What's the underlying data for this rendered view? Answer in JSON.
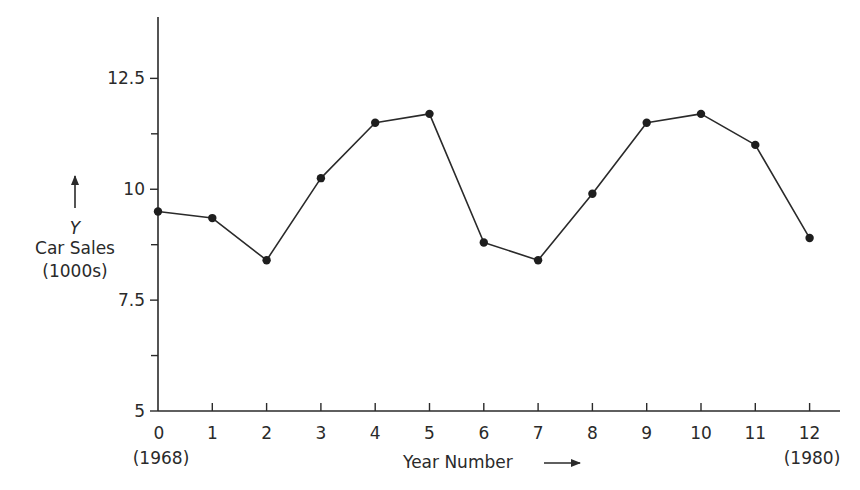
{
  "chart_data": {
    "type": "line",
    "title": "",
    "xlabel": "Year Number",
    "ylabel": "Car Sales (1000s)",
    "ylabel_symbol": "Y",
    "x": [
      0,
      1,
      2,
      3,
      4,
      5,
      6,
      7,
      8,
      9,
      10,
      11,
      12
    ],
    "x_tick_labels": [
      "0",
      "1",
      "2",
      "3",
      "4",
      "5",
      "6",
      "7",
      "8",
      "9",
      "10",
      "11",
      "12"
    ],
    "x_annotations": [
      {
        "at": 0,
        "text": "(1968)"
      },
      {
        "at": 12,
        "text": "(1980)"
      }
    ],
    "y_ticks": [
      5,
      7.5,
      10,
      12.5
    ],
    "y_tick_labels": [
      "5",
      "7.5",
      "10",
      "12.5"
    ],
    "y_minor_ticks": [
      6.25,
      8.75,
      11.25
    ],
    "series": [
      {
        "name": "Car Sales",
        "values": [
          9.5,
          9.35,
          8.4,
          10.25,
          11.5,
          11.7,
          8.8,
          8.4,
          9.9,
          11.5,
          11.7,
          11.0,
          8.9
        ],
        "markers": true,
        "color": "#1e1e1e"
      }
    ],
    "xlim": [
      0,
      12.5
    ],
    "ylim": [
      5,
      13.7
    ],
    "grid": false,
    "legend": null
  },
  "labels": {
    "y_symbol": "Y",
    "y_title_line1": "Car Sales",
    "y_title_line2": "(1000s)",
    "x_title": "Year Number",
    "x_start_year": "(1968)",
    "x_end_year": "(1980)"
  }
}
